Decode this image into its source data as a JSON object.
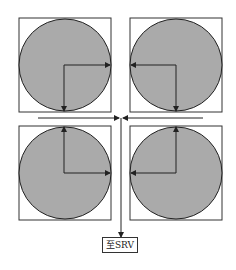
{
  "diagram": {
    "colors": {
      "circle_fill": "#aaaaaa",
      "stroke": "#222222",
      "background": "#ffffff"
    },
    "units": [
      {
        "id": "top-left",
        "arrows": [
          "right",
          "down"
        ]
      },
      {
        "id": "top-right",
        "arrows": [
          "left",
          "down"
        ]
      },
      {
        "id": "bottom-left",
        "arrows": [
          "up",
          "right"
        ]
      },
      {
        "id": "bottom-right",
        "arrows": [
          "up",
          "left"
        ]
      }
    ],
    "collector": {
      "description": "horizontal collector lines converging to center, then vertical line down"
    },
    "output_label": "至SRV"
  }
}
